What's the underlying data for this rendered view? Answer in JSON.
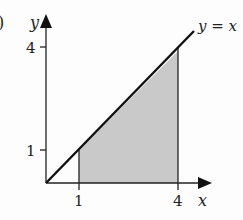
{
  "figure": {
    "panel_label_fragment": ")",
    "axes": {
      "x_label": "x",
      "y_label": "y",
      "x_ticks": [
        "1",
        "4"
      ],
      "y_ticks": [
        "1",
        "4"
      ]
    },
    "line_label": "y = x",
    "shaded_region": {
      "description": "Region under y = x between x = 1 and x = 4",
      "fill_color": "#c8c8c8"
    },
    "colors": {
      "line": "#111111",
      "axes": "#222222",
      "background": "#fdfdfd"
    }
  }
}
